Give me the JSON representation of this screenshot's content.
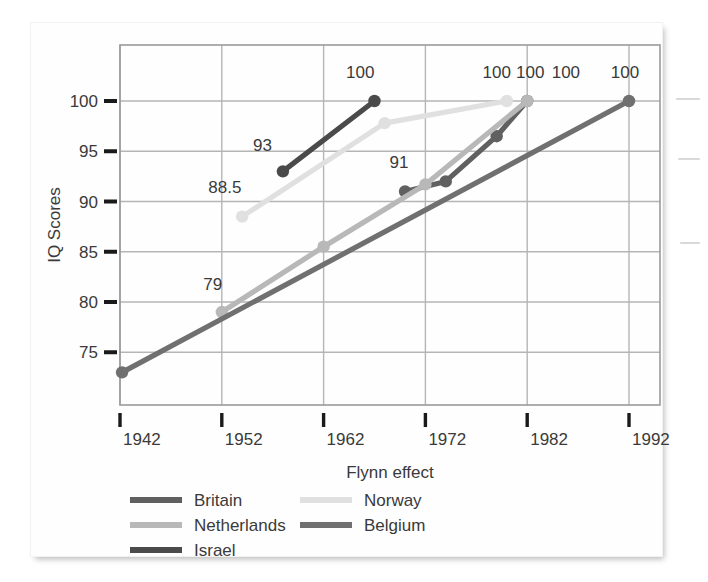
{
  "chart_data": {
    "type": "line",
    "title": "",
    "xlabel": "Flynn effect",
    "ylabel": "IQ Scores",
    "xlim": [
      1938,
      1996
    ],
    "ylim": [
      71,
      103
    ],
    "x_ticks": [
      1942,
      1952,
      1962,
      1972,
      1982,
      1992
    ],
    "y_ticks": [
      75,
      80,
      85,
      90,
      95,
      100
    ],
    "grid": true,
    "legend_position": "below-axis",
    "series": [
      {
        "name": "Britain",
        "color": "#606060",
        "points": [
          {
            "x": 1970,
            "y": 91,
            "label": "91"
          },
          {
            "x": 1974,
            "y": 92,
            "label": ""
          },
          {
            "x": 1979,
            "y": 96.5,
            "label": ""
          },
          {
            "x": 1982,
            "y": 100,
            "label": "100"
          }
        ]
      },
      {
        "name": "Netherlands",
        "color": "#b8b8b8",
        "points": [
          {
            "x": 1952,
            "y": 79,
            "label": "79"
          },
          {
            "x": 1962,
            "y": 85.5,
            "label": ""
          },
          {
            "x": 1972,
            "y": 91.7,
            "label": ""
          },
          {
            "x": 1982,
            "y": 100,
            "label": "100"
          }
        ]
      },
      {
        "name": "Israel",
        "color": "#4a4a4a",
        "points": [
          {
            "x": 1958,
            "y": 93,
            "label": "93"
          },
          {
            "x": 1967,
            "y": 100,
            "label": "100"
          }
        ]
      },
      {
        "name": "Norway",
        "color": "#e0e0e0",
        "points": [
          {
            "x": 1954,
            "y": 88.5,
            "label": "88.5"
          },
          {
            "x": 1968,
            "y": 97.8,
            "label": ""
          },
          {
            "x": 1980,
            "y": 100,
            "label": "100"
          }
        ]
      },
      {
        "name": "Belgium",
        "color": "#707070",
        "points": [
          {
            "x": 1942.2,
            "y": 73,
            "label": ""
          },
          {
            "x": 1992,
            "y": 100,
            "label": "100"
          }
        ]
      }
    ],
    "point_labels": [
      {
        "text": "100",
        "x": 1965.6,
        "y": 102.3
      },
      {
        "text": "93",
        "x": 1956.0,
        "y": 95.0
      },
      {
        "text": "88.5",
        "x": 1952.3,
        "y": 90.8
      },
      {
        "text": "91",
        "x": 1969.4,
        "y": 93.3
      },
      {
        "text": "79",
        "x": 1951.1,
        "y": 81.2
      },
      {
        "text": "100",
        "x": 1979.0,
        "y": 102.3
      },
      {
        "text": "100",
        "x": 1982.3,
        "y": 102.3
      },
      {
        "text": "100",
        "x": 1985.8,
        "y": 102.3
      },
      {
        "text": "100",
        "x": 1991.6,
        "y": 102.3
      }
    ]
  },
  "axes": {
    "y_axis_title": "IQ Scores",
    "x_axis_title": "Flynn effect",
    "y_tick_labels": [
      "100",
      "95",
      "90",
      "85",
      "80",
      "75"
    ],
    "x_tick_labels": [
      "1942",
      "1952",
      "1962",
      "1972",
      "1982",
      "1992"
    ]
  },
  "legend": {
    "entries": [
      {
        "label": "Britain",
        "color": "#606060",
        "column": 0,
        "row": 0
      },
      {
        "label": "Netherlands",
        "color": "#b8b8b8",
        "column": 0,
        "row": 1
      },
      {
        "label": "Israel",
        "color": "#4a4a4a",
        "column": 0,
        "row": 2
      },
      {
        "label": "Norway",
        "color": "#e0e0e0",
        "column": 1,
        "row": 0
      },
      {
        "label": "Belgium",
        "color": "#707070",
        "column": 1,
        "row": 1
      }
    ]
  },
  "colors": {
    "grid": "#b5b5b5",
    "frame": "#9a9a9a",
    "tick_mark": "#1a1a1a",
    "text": "#3a3a3a",
    "background": "#ffffff"
  }
}
